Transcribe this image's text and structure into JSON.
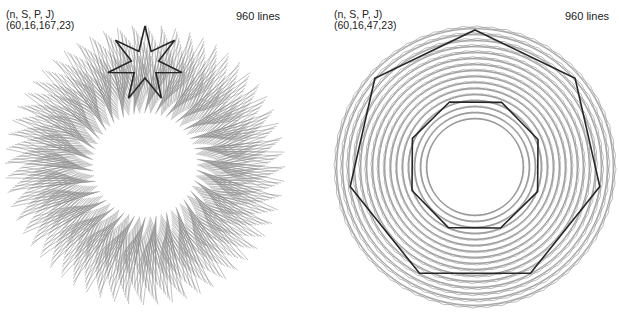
{
  "colors": {
    "mesh": "#8a8a8a",
    "highlight": "#262626",
    "background": "#ffffff"
  },
  "panels": [
    {
      "params_label": "(n, S, P, J)",
      "params_values": "(60,16,167,23)",
      "n": 60,
      "S": 16,
      "P": 167,
      "J": 23,
      "lines_count": "960 lines",
      "center": [
        145,
        165
      ],
      "outer_radius": 140,
      "inner_radius": 52,
      "style": "spiky",
      "highlight": {
        "type": "star",
        "center": [
          145,
          64
        ],
        "outer": 38,
        "inner": 14,
        "points": 7,
        "rotation": -90
      }
    },
    {
      "params_label": "(n, S, P, J)",
      "params_values": "(60,16,47,23)",
      "n": 60,
      "S": 16,
      "P": 47,
      "J": 23,
      "lines_count": "960 lines",
      "center": [
        475,
        167
      ],
      "outer_radius": 140,
      "inner_radius": 48,
      "style": "lattice",
      "highlight": {
        "type": "polygons",
        "shapes": [
          {
            "sides": 7,
            "radius": 128,
            "rotation": -90,
            "center": [
              475,
              158
            ]
          },
          {
            "sides": 8,
            "radius": 68,
            "rotation": -112,
            "center": [
              475,
              165
            ]
          }
        ]
      }
    }
  ]
}
